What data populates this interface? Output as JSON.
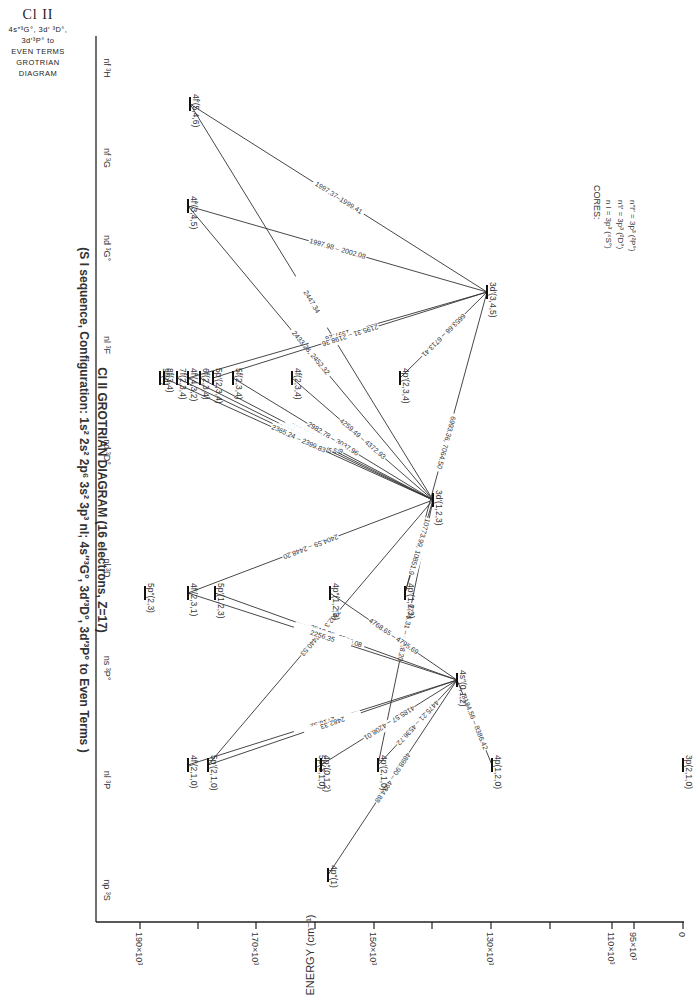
{
  "corner": {
    "title": "Cl II",
    "lines": [
      "4s″³G°, 3d′ ³D°,",
      "3d′³P°  to",
      "EVEN TERMS",
      "GROTRIAN",
      "DIAGRAM"
    ]
  },
  "title": {
    "line1": "Cl II  GROTRIAN DIAGRAM (16 electrons, Z=17)",
    "line2": "(S I sequence, Configuration: 1s² 2s² 2p⁶ 3s² 3p³ nl; 4s″³G°, 3d′³D°, 3d′³P° to Even Terms )"
  },
  "cores": {
    "heading": "CORES:",
    "lines": [
      "n l = 3p³ (⁴S°)",
      "n′l′ = 3p³ (²D°)",
      "n″l″ = 3p³ (²P°)"
    ]
  },
  "axis": {
    "label": "ENERGY  (cm⁻¹)",
    "ticks": [
      {
        "y": 140,
        "label": "190×10³"
      },
      {
        "y": 198,
        "label": ""
      },
      {
        "y": 256,
        "label": "170×10³"
      },
      {
        "y": 315,
        "label": ""
      },
      {
        "y": 374,
        "label": "150×10³"
      },
      {
        "y": 432,
        "label": ""
      },
      {
        "y": 491,
        "label": "130×10³"
      },
      {
        "y": 550,
        "label": ""
      },
      {
        "y": 612,
        "label": "110×10³"
      },
      {
        "y": 634,
        "label": "95×10³"
      },
      {
        "y": 683,
        "label": "0"
      }
    ]
  },
  "columns": [
    {
      "x": 68,
      "label": "nf ³H"
    },
    {
      "x": 158,
      "label": "nf ³G"
    },
    {
      "x": 248,
      "label": "nd ³G°"
    },
    {
      "x": 345,
      "label": "nl ³F"
    },
    {
      "x": 452,
      "label": "nd ³D°"
    },
    {
      "x": 568,
      "label": "nl ³D"
    },
    {
      "x": 668,
      "label": "ns ³P°"
    },
    {
      "x": 780,
      "label": "nl ³P"
    },
    {
      "x": 890,
      "label": "np ³S"
    }
  ],
  "levels": [
    {
      "id": "4f5",
      "x": 104,
      "y": 188,
      "label": "4f′(5,4,6)"
    },
    {
      "id": "4f3",
      "x": 206,
      "y": 188,
      "label": "4f′(3,4,5)"
    },
    {
      "id": "3d345",
      "x": 292,
      "y": 485,
      "label": "3d′(3,4,5)"
    },
    {
      "id": "9f",
      "x": 378,
      "y": 160,
      "label": "9f(4)"
    },
    {
      "id": "8f",
      "x": 378,
      "y": 164,
      "label": "8f(3,4)"
    },
    {
      "id": "7f",
      "x": 378,
      "y": 177,
      "label": "7f(2,3,4)"
    },
    {
      "id": "4f432",
      "x": 378,
      "y": 188,
      "label": "4f′(4,3,2)"
    },
    {
      "id": "6f",
      "x": 378,
      "y": 200,
      "label": "6f(2,3,4)"
    },
    {
      "id": "5p234",
      "x": 378,
      "y": 213,
      "label": "5p′(2,3,4)"
    },
    {
      "id": "5f",
      "x": 378,
      "y": 233,
      "label": "5f(2,3,4)"
    },
    {
      "id": "4f234",
      "x": 378,
      "y": 292,
      "label": "4f(2,3,4)"
    },
    {
      "id": "4p234",
      "x": 378,
      "y": 400,
      "label": "4p′(2,3,4)"
    },
    {
      "id": "3d123",
      "x": 500,
      "y": 433,
      "label": "3d′(1,2,3)"
    },
    {
      "id": "5p23",
      "x": 593,
      "y": 145,
      "label": "5p″(2,3)"
    },
    {
      "id": "4f231",
      "x": 593,
      "y": 188,
      "label": "4f′(2,3,1)"
    },
    {
      "id": "5p123",
      "x": 593,
      "y": 215,
      "label": "5p′(1,2,3)"
    },
    {
      "id": "4p123b",
      "x": 593,
      "y": 330,
      "label": "4p″(1,2,3)"
    },
    {
      "id": "4p123a",
      "x": 593,
      "y": 405,
      "label": "4p′(1,2,3)"
    },
    {
      "id": "4s012",
      "x": 680,
      "y": 457,
      "label": "4s″(0,1,2)"
    },
    {
      "id": "4f210",
      "x": 765,
      "y": 188,
      "label": "4f′(2,1,0)"
    },
    {
      "id": "5p210",
      "x": 765,
      "y": 208,
      "label": "5p′(2,1,0)"
    },
    {
      "id": "5p210b",
      "x": 765,
      "y": 316,
      "label": "5p(2,1,0)"
    },
    {
      "id": "4p012",
      "x": 765,
      "y": 321,
      "label": "4p″(0,1,2)"
    },
    {
      "id": "4p210",
      "x": 765,
      "y": 378,
      "label": "4p′(2,1,0)"
    },
    {
      "id": "4p120",
      "x": 765,
      "y": 492,
      "label": "4p(1,2,0)"
    },
    {
      "id": "3p210",
      "x": 765,
      "y": 683,
      "label": "3p(2,1,0)"
    },
    {
      "id": "4p1",
      "x": 875,
      "y": 328,
      "label": "4p″(1)"
    }
  ],
  "transitions": [
    {
      "from": "4f5",
      "to": "3d345",
      "label": "1997.37–1999.41"
    },
    {
      "from": "4f5",
      "to": "3d123",
      "label": "2447.34"
    },
    {
      "from": "4f3",
      "to": "3d345",
      "label": "1997.98 – 2002.08"
    },
    {
      "from": "4f3",
      "to": "3d123",
      "label": "2433.28, 2452.32"
    },
    {
      "from": "4f432",
      "to": "3d345",
      "label": "1997.26"
    },
    {
      "from": "5p234",
      "to": "3d345",
      "label": "2195.31 – 2198.36"
    },
    {
      "from": "4p234",
      "to": "3d345",
      "label": "6653.68 – 6713.41"
    },
    {
      "from": "4p123a",
      "to": "3d345",
      "label": "6993.36, 7064.50"
    },
    {
      "from": "5f",
      "to": "3d123",
      "label": "2982.78 – 3037.96"
    },
    {
      "from": "4f234",
      "to": "3d123",
      "label": "4259.49 – 4372.93"
    },
    {
      "from": "6f",
      "to": "3d123",
      "label": "2709.48 – 2747.99"
    },
    {
      "from": "4f432",
      "to": "3d123",
      "label": "2564.94 – 2605.65"
    },
    {
      "from": "7f",
      "to": "3d123",
      "label": "2407.08 – 2445.35"
    },
    {
      "from": "8f",
      "to": "3d123",
      "label": "2365.24 – 2399.83"
    },
    {
      "from": "4f231",
      "to": "3d123",
      "label": "2404.59 – 2448.20"
    },
    {
      "from": "5p210",
      "to": "3d123",
      "label": "2402.35 – 2440.53"
    },
    {
      "from": "4p210",
      "to": "3d123",
      "label": "4776.31 – 4928.20"
    },
    {
      "from": "4p123a",
      "to": "3d123",
      "label": "10773.99, 10851.9"
    },
    {
      "from": "5p123",
      "to": "4s012",
      "label": "2519.85, 2520.08"
    },
    {
      "from": "4f231",
      "to": "4s012",
      "label": "2256.35"
    },
    {
      "from": "4p123b",
      "to": "4s012",
      "label": "4768.65 – 4795.69"
    },
    {
      "from": "4f210",
      "to": "4s012",
      "label": "2716.52"
    },
    {
      "from": "5p210",
      "to": "4s012",
      "label": "2482.33"
    },
    {
      "from": "4p012",
      "to": "4s012",
      "label": "4185.57 – 4208.01"
    },
    {
      "from": "4p210",
      "to": "4s012",
      "label": "4475.21 – 4536.72"
    },
    {
      "from": "4p120",
      "to": "4s012",
      "label": "8184.56 – 8386.42"
    },
    {
      "from": "4p1",
      "to": "4s012",
      "label": "4898.90 – 4924.88"
    }
  ]
}
